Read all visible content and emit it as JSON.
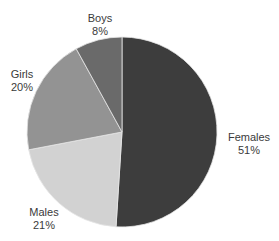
{
  "chart_data": {
    "type": "pie",
    "title": "",
    "categories": [
      "Females",
      "Males",
      "Girls",
      "Boys"
    ],
    "values": [
      51,
      21,
      20,
      8
    ],
    "unit": "%",
    "colors": [
      "#3d3d3d",
      "#d2d2d2",
      "#939393",
      "#6a6a6a"
    ],
    "start_angle_deg": 0,
    "direction": "clockwise",
    "legend": "none",
    "labels": [
      {
        "name": "Females",
        "pct": "51%"
      },
      {
        "name": "Males",
        "pct": "21%"
      },
      {
        "name": "Girls",
        "pct": "20%"
      },
      {
        "name": "Boys",
        "pct": "8%"
      }
    ]
  }
}
